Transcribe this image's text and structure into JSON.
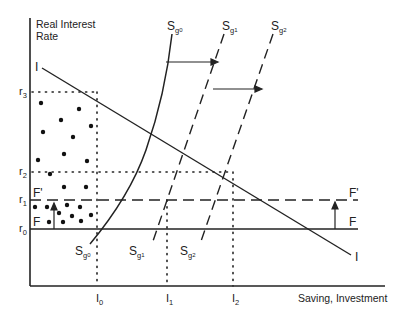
{
  "diagram": {
    "type": "economics-saving-investment",
    "y_axis": {
      "label_line1": "Real Interest",
      "label_line2": "Rate"
    },
    "x_axis": {
      "label": "Saving, Investment"
    },
    "interest_rates": [
      {
        "id": "r3",
        "base": "r",
        "sub": "3"
      },
      {
        "id": "r2",
        "base": "r",
        "sub": "2"
      },
      {
        "id": "r1",
        "base": "r",
        "sub": "1"
      },
      {
        "id": "r0",
        "base": "r",
        "sub": "0"
      }
    ],
    "quantities": [
      {
        "id": "I0",
        "base": "I",
        "sub": "0"
      },
      {
        "id": "I1",
        "base": "I",
        "sub": "1"
      },
      {
        "id": "I2",
        "base": "I",
        "sub": "2"
      }
    ],
    "curves": {
      "investment": {
        "label": "I",
        "style": "solid"
      },
      "saving": [
        {
          "base": "S",
          "sub": "g",
          "subsub": "0",
          "style": "solid"
        },
        {
          "base": "S",
          "sub": "g",
          "subsub": "1",
          "style": "dashed"
        },
        {
          "base": "S",
          "sub": "g",
          "subsub": "2",
          "style": "dashed"
        }
      ],
      "floor": {
        "label": "F",
        "style": "solid"
      },
      "floor_shifted": {
        "label": "F'",
        "style": "dashed"
      }
    },
    "colors": {
      "line": "#222222",
      "background": "#ffffff"
    }
  }
}
